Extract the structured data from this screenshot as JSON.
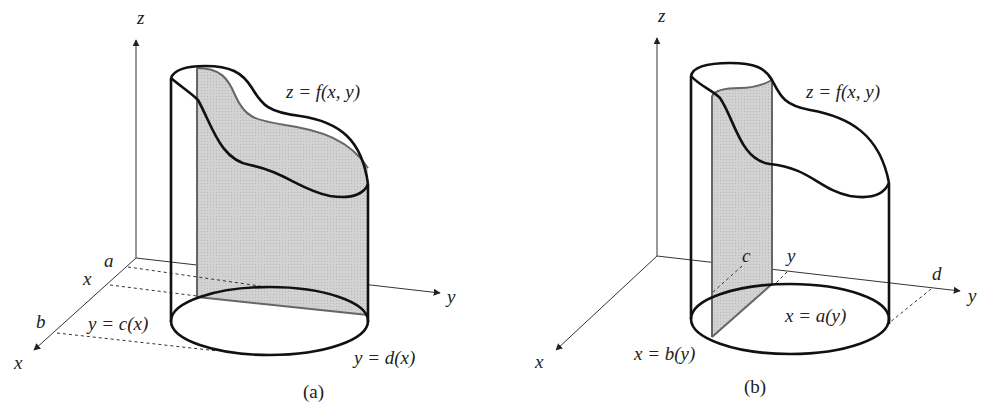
{
  "figure": {
    "colors": {
      "line": "#111111",
      "axis": "#333333",
      "shade": "#cfcfcf",
      "slab_edge": "#666666",
      "background": "#ffffff"
    },
    "panels": [
      {
        "id": "a",
        "caption": "(a)",
        "axes": {
          "z": "z",
          "y": "y",
          "x": "x"
        },
        "surface_label": "z = f(x, y)",
        "x_ticks": [
          "a",
          "x",
          "b"
        ],
        "lower_bound_label": "y = c(x)",
        "upper_bound_label": "y = d(x)",
        "slice": "plane of constant x (shaded), parallel to y-z plane"
      },
      {
        "id": "b",
        "caption": "(b)",
        "axes": {
          "z": "z",
          "y": "y",
          "x": "x"
        },
        "surface_label": "z = f(x, y)",
        "y_ticks": [
          "c",
          "y",
          "d"
        ],
        "lower_bound_label": "x = a(y)",
        "upper_bound_label": "x = b(y)",
        "slice": "plane of constant y (shaded), parallel to x-z plane"
      }
    ]
  }
}
